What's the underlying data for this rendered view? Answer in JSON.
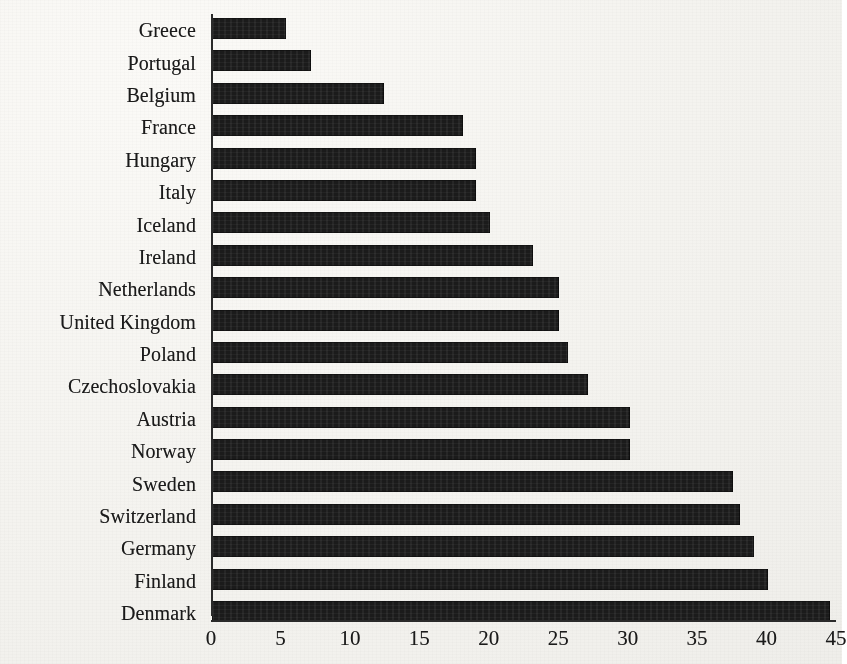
{
  "chart_data": {
    "type": "bar",
    "orientation": "horizontal",
    "title": "",
    "xlabel": "",
    "ylabel": "",
    "xlim": [
      0,
      45
    ],
    "grid": false,
    "legend": null,
    "bar_color": "#1b1b1b",
    "axis_color": "#2b2b2b",
    "xticks": [
      0,
      5,
      10,
      15,
      20,
      25,
      30,
      35,
      40,
      45
    ],
    "xtick_labels": [
      "0",
      "5",
      "10",
      "15",
      "20",
      "25",
      "30",
      "35",
      "40",
      "45"
    ],
    "categories": [
      "Greece",
      "Portugal",
      "Belgium",
      "France",
      "Hungary",
      "Italy",
      "Iceland",
      "Ireland",
      "Netherlands",
      "United Kingdom",
      "Poland",
      "Czechoslovakia",
      "Austria",
      "Norway",
      "Sweden",
      "Switzerland",
      "Germany",
      "Finland",
      "Denmark"
    ],
    "values": [
      5.3,
      7.1,
      12.4,
      18.1,
      19.0,
      19.0,
      20.0,
      23.1,
      25.0,
      25.0,
      25.6,
      27.1,
      30.1,
      30.1,
      37.5,
      38.0,
      39.0,
      40.0,
      44.5
    ],
    "bars": [
      {
        "category": "Greece",
        "value": 5.3
      },
      {
        "category": "Portugal",
        "value": 7.1
      },
      {
        "category": "Belgium",
        "value": 12.4
      },
      {
        "category": "France",
        "value": 18.1
      },
      {
        "category": "Hungary",
        "value": 19.0
      },
      {
        "category": "Italy",
        "value": 19.0
      },
      {
        "category": "Iceland",
        "value": 20.0
      },
      {
        "category": "Ireland",
        "value": 23.1
      },
      {
        "category": "Netherlands",
        "value": 25.0
      },
      {
        "category": "United Kingdom",
        "value": 25.0
      },
      {
        "category": "Poland",
        "value": 25.6
      },
      {
        "category": "Czechoslovakia",
        "value": 27.1
      },
      {
        "category": "Austria",
        "value": 30.1
      },
      {
        "category": "Norway",
        "value": 30.1
      },
      {
        "category": "Sweden",
        "value": 37.5
      },
      {
        "category": "Switzerland",
        "value": 38.0
      },
      {
        "category": "Germany",
        "value": 39.0
      },
      {
        "category": "Finland",
        "value": 40.0
      },
      {
        "category": "Denmark",
        "value": 44.5
      }
    ]
  }
}
